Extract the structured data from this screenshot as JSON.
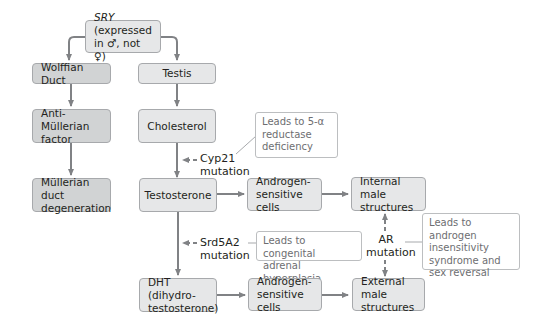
{
  "diagram": {
    "nodes": {
      "sry": {
        "prefix": "SRY",
        "text": " (expressed in ♂, not ♀)"
      },
      "wolffian": "Wolffian Duct",
      "testis": "Testis",
      "amf": "Anti-Müllerian factor",
      "cholesterol": "Cholesterol",
      "mullerian": "Müllerian duct degeneration",
      "testosterone": "Testosterone",
      "androgen_cells_1": "Androgen-sensitive cells",
      "internal": "Internal male structures",
      "dht": "DHT (dihydro-testosterone)",
      "androgen_cells_2": "Androgen-sensitive cells",
      "external": "External male structures"
    },
    "mutations": {
      "cyp21": "Cyp21 mutation",
      "srd5a2": "Srd5A2 mutation",
      "ar": "AR mutation"
    },
    "notes": {
      "cyp21_note": "Leads to 5-α reductase deficiency",
      "srd5a2_note": "Leads to congenital adrenal hyperplasia",
      "ar_note": "Leads to androgen insensitivity syndrome and sex reversal"
    },
    "colors": {
      "arrow": "#808285",
      "box_light": "#e6e7e8",
      "box_dark": "#d1d3d4",
      "note_text": "#6d6e71"
    }
  }
}
